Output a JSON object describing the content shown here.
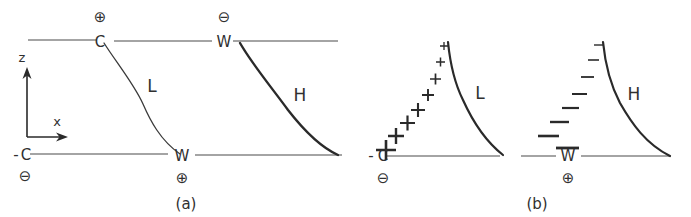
{
  "figure": {
    "title": "",
    "background_color": "#ffffff",
    "ink_color": "#303030",
    "panels": [
      {
        "id": "a",
        "caption": "(a)",
        "axes": {
          "vertical_label": "z",
          "horizontal_label": "x"
        },
        "boundaries": [
          {
            "name": "upper-boundary",
            "left_label": "C",
            "left_charge": "⊕",
            "left_charge_position": "above",
            "right_label": "W",
            "right_charge": "⊖",
            "right_charge_position": "above"
          },
          {
            "name": "lower-boundary",
            "left_label": "C",
            "left_prefix": "-",
            "left_charge": "⊖",
            "left_charge_position": "below",
            "right_label": "W",
            "right_charge": "⊕",
            "right_charge_position": "below"
          }
        ],
        "curves": [
          {
            "name": "L",
            "label": "L",
            "style": "thin"
          },
          {
            "name": "H",
            "label": "H",
            "style": "thick"
          }
        ]
      },
      {
        "id": "b",
        "caption": "(b)",
        "baseline_labels": {
          "left_label": "C",
          "left_prefix": "-",
          "left_charge_below": "⊖",
          "left_sign_above": "+",
          "right_label": "W",
          "right_charge_below": "⊕",
          "right_sign_above": "-"
        },
        "curves": [
          {
            "name": "L",
            "label": "L",
            "style": "thick"
          },
          {
            "name": "H",
            "label": "H",
            "style": "thick"
          }
        ],
        "charge_columns": [
          {
            "name": "positive-charge-stack",
            "sign": "+",
            "count": 8,
            "sizes": [
              7,
              9,
              11,
              13,
              15,
              17,
              19,
              22
            ],
            "description": "plus signs increasing in size from top to bottom"
          },
          {
            "name": "negative-charge-stack",
            "sign": "−",
            "count": 8,
            "sizes": [
              7,
              9,
              11,
              13,
              15,
              17,
              19,
              22
            ],
            "description": "minus signs increasing in width from top to bottom"
          }
        ]
      }
    ]
  }
}
